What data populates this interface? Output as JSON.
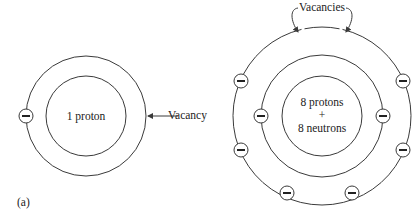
{
  "figure": {
    "panel_label": "(a)",
    "hydrogen_atom": {
      "nucleus_label": "1 proton",
      "vacancy_label": "Vacancy",
      "electrons": 1,
      "vacancies": 1
    },
    "oxygen_atom": {
      "nucleus_line1": "8 protons",
      "nucleus_plus": "+",
      "nucleus_line2": "8 neutrons",
      "vacancies_label": "Vacancies",
      "inner_shell_electrons": 2,
      "outer_shell_electrons": 6,
      "vacancies": 2
    },
    "electron_symbol": "minus-in-circle",
    "colors": {
      "line": "#3a3a3a",
      "text": "#222222",
      "background": "#ffffff"
    }
  }
}
